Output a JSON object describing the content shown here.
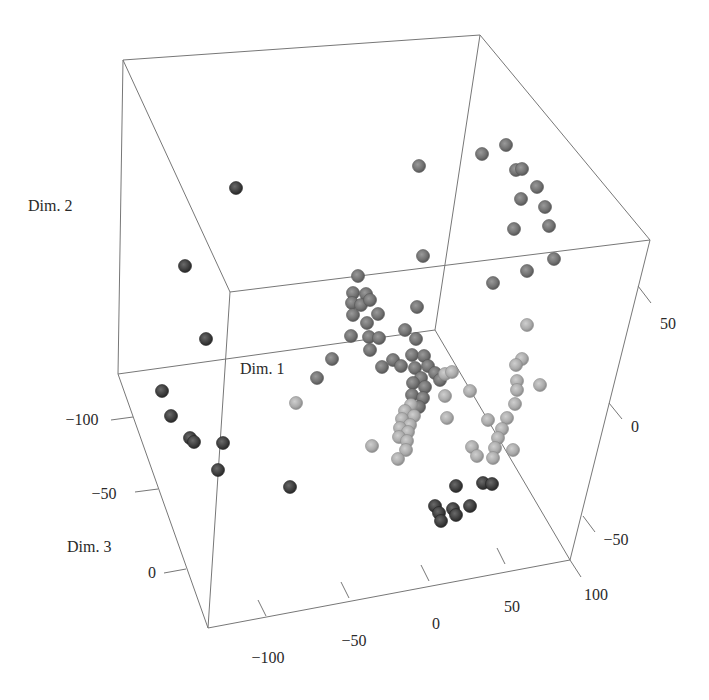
{
  "chart_data": {
    "type": "scatter",
    "subtype": "3d-scatter",
    "title": "",
    "axes": {
      "x": {
        "label": "Dim. 1",
        "ticks": [
          "-100",
          "-50",
          "0",
          "50",
          "100"
        ]
      },
      "y": {
        "label": "Dim. 2",
        "ticks": [
          "-50",
          "0",
          "50"
        ]
      },
      "z": {
        "label": "Dim. 3",
        "ticks": [
          "-100",
          "-50",
          "0"
        ]
      }
    },
    "grid": false,
    "legend": null,
    "colors": {
      "dark": "#3a3a3a",
      "mid": "#6e6e6e",
      "light": "#a9a9a9",
      "box": "#777777"
    },
    "box": {
      "vertices": {
        "A": [
          123,
          60
        ],
        "B": [
          480,
          35
        ],
        "C": [
          650,
          240
        ],
        "D": [
          230,
          292
        ],
        "E": [
          118,
          374
        ],
        "F": [
          208,
          628
        ],
        "G": [
          570,
          560
        ],
        "H": [
          435,
          330
        ]
      },
      "edges": [
        [
          "A",
          "B"
        ],
        [
          "A",
          "D"
        ],
        [
          "B",
          "C"
        ],
        [
          "D",
          "C"
        ],
        [
          "A",
          "E"
        ],
        [
          "E",
          "F"
        ],
        [
          "F",
          "G"
        ],
        [
          "G",
          "C"
        ],
        [
          "D",
          "F"
        ],
        [
          "B",
          "H"
        ],
        [
          "H",
          "G"
        ],
        [
          "E",
          "H"
        ]
      ]
    },
    "tick_marks": {
      "x": [
        {
          "label": "-100",
          "p": [
            258,
            600
          ],
          "t": [
            266,
            616
          ],
          "lx": 268,
          "ly": 663
        },
        {
          "label": "-50",
          "p": [
            341,
            582
          ],
          "t": [
            349,
            598
          ],
          "lx": 354,
          "ly": 646
        },
        {
          "label": "0",
          "p": [
            421,
            565
          ],
          "t": [
            429,
            581
          ],
          "lx": 436,
          "ly": 629
        },
        {
          "label": "50",
          "p": [
            497,
            548
          ],
          "t": [
            505,
            564
          ],
          "lx": 512,
          "ly": 612
        },
        {
          "label": "100",
          "p": [
            570,
            560
          ],
          "t": [
            581,
            577
          ],
          "lx": 596,
          "ly": 600
        }
      ],
      "y": [
        {
          "label": "50",
          "p": [
            638,
            286
          ],
          "t": [
            651,
            303
          ],
          "lx": 668,
          "ly": 329
        },
        {
          "label": "0",
          "p": [
            609,
            403
          ],
          "t": [
            622,
            419
          ],
          "lx": 635,
          "ly": 432
        },
        {
          "label": "-50",
          "p": [
            583,
            516
          ],
          "t": [
            595,
            532
          ],
          "lx": 616,
          "ly": 545
        }
      ],
      "z": [
        {
          "label": "-100",
          "p": [
            133,
            417
          ],
          "t": [
            111,
            420
          ],
          "lx": 82,
          "ly": 425
        },
        {
          "label": "-50",
          "p": [
            158,
            489
          ],
          "t": [
            135,
            492
          ],
          "lx": 104,
          "ly": 499
        },
        {
          "label": "0",
          "p": [
            186,
            569
          ],
          "t": [
            164,
            573
          ],
          "lx": 152,
          "ly": 578
        }
      ]
    },
    "label_positions": {
      "dim1": [
        240,
        374
      ],
      "dim2": [
        28,
        211
      ],
      "dim3": [
        67,
        552
      ]
    },
    "points": [
      {
        "x": 236,
        "y": 188,
        "c": "dark"
      },
      {
        "x": 185,
        "y": 266,
        "c": "dark"
      },
      {
        "x": 206,
        "y": 339,
        "c": "dark"
      },
      {
        "x": 162,
        "y": 391,
        "c": "dark"
      },
      {
        "x": 171,
        "y": 416,
        "c": "dark"
      },
      {
        "x": 190,
        "y": 438,
        "c": "dark"
      },
      {
        "x": 194,
        "y": 442,
        "c": "dark"
      },
      {
        "x": 223,
        "y": 443,
        "c": "dark"
      },
      {
        "x": 218,
        "y": 470,
        "c": "dark"
      },
      {
        "x": 290,
        "y": 487,
        "c": "dark"
      },
      {
        "x": 419,
        "y": 166,
        "c": "mid"
      },
      {
        "x": 482,
        "y": 154,
        "c": "mid"
      },
      {
        "x": 506,
        "y": 145,
        "c": "mid"
      },
      {
        "x": 516,
        "y": 170,
        "c": "mid"
      },
      {
        "x": 522,
        "y": 169,
        "c": "mid"
      },
      {
        "x": 537,
        "y": 187,
        "c": "mid"
      },
      {
        "x": 521,
        "y": 199,
        "c": "mid"
      },
      {
        "x": 545,
        "y": 207,
        "c": "mid"
      },
      {
        "x": 514,
        "y": 229,
        "c": "mid"
      },
      {
        "x": 549,
        "y": 226,
        "c": "mid"
      },
      {
        "x": 423,
        "y": 256,
        "c": "mid"
      },
      {
        "x": 554,
        "y": 259,
        "c": "mid"
      },
      {
        "x": 527,
        "y": 271,
        "c": "mid"
      },
      {
        "x": 493,
        "y": 283,
        "c": "mid"
      },
      {
        "x": 417,
        "y": 307,
        "c": "mid"
      },
      {
        "x": 358,
        "y": 276,
        "c": "mid"
      },
      {
        "x": 353,
        "y": 293,
        "c": "mid"
      },
      {
        "x": 366,
        "y": 294,
        "c": "mid"
      },
      {
        "x": 352,
        "y": 303,
        "c": "mid"
      },
      {
        "x": 361,
        "y": 305,
        "c": "mid"
      },
      {
        "x": 370,
        "y": 300,
        "c": "mid"
      },
      {
        "x": 353,
        "y": 315,
        "c": "mid"
      },
      {
        "x": 378,
        "y": 314,
        "c": "mid"
      },
      {
        "x": 367,
        "y": 323,
        "c": "mid"
      },
      {
        "x": 351,
        "y": 336,
        "c": "mid"
      },
      {
        "x": 369,
        "y": 337,
        "c": "mid"
      },
      {
        "x": 379,
        "y": 338,
        "c": "mid"
      },
      {
        "x": 370,
        "y": 350,
        "c": "mid"
      },
      {
        "x": 405,
        "y": 330,
        "c": "mid"
      },
      {
        "x": 416,
        "y": 339,
        "c": "mid"
      },
      {
        "x": 332,
        "y": 359,
        "c": "mid"
      },
      {
        "x": 317,
        "y": 378,
        "c": "mid"
      },
      {
        "x": 382,
        "y": 367,
        "c": "mid"
      },
      {
        "x": 393,
        "y": 360,
        "c": "mid"
      },
      {
        "x": 401,
        "y": 366,
        "c": "mid"
      },
      {
        "x": 412,
        "y": 355,
        "c": "mid"
      },
      {
        "x": 424,
        "y": 356,
        "c": "mid"
      },
      {
        "x": 415,
        "y": 368,
        "c": "mid"
      },
      {
        "x": 428,
        "y": 366,
        "c": "mid"
      },
      {
        "x": 435,
        "y": 373,
        "c": "mid"
      },
      {
        "x": 421,
        "y": 378,
        "c": "mid"
      },
      {
        "x": 440,
        "y": 380,
        "c": "mid"
      },
      {
        "x": 445,
        "y": 374,
        "c": "light"
      },
      {
        "x": 452,
        "y": 372,
        "c": "light"
      },
      {
        "x": 413,
        "y": 383,
        "c": "mid"
      },
      {
        "x": 425,
        "y": 387,
        "c": "mid"
      },
      {
        "x": 412,
        "y": 395,
        "c": "mid"
      },
      {
        "x": 423,
        "y": 398,
        "c": "mid"
      },
      {
        "x": 419,
        "y": 407,
        "c": "mid"
      },
      {
        "x": 411,
        "y": 405,
        "c": "light"
      },
      {
        "x": 405,
        "y": 411,
        "c": "light"
      },
      {
        "x": 414,
        "y": 416,
        "c": "light"
      },
      {
        "x": 402,
        "y": 419,
        "c": "light"
      },
      {
        "x": 410,
        "y": 425,
        "c": "light"
      },
      {
        "x": 400,
        "y": 428,
        "c": "light"
      },
      {
        "x": 408,
        "y": 432,
        "c": "light"
      },
      {
        "x": 399,
        "y": 437,
        "c": "light"
      },
      {
        "x": 407,
        "y": 441,
        "c": "light"
      },
      {
        "x": 406,
        "y": 450,
        "c": "light"
      },
      {
        "x": 398,
        "y": 459,
        "c": "light"
      },
      {
        "x": 372,
        "y": 446,
        "c": "light"
      },
      {
        "x": 296,
        "y": 403,
        "c": "light"
      },
      {
        "x": 445,
        "y": 396,
        "c": "light"
      },
      {
        "x": 447,
        "y": 418,
        "c": "light"
      },
      {
        "x": 470,
        "y": 391,
        "c": "light"
      },
      {
        "x": 488,
        "y": 420,
        "c": "light"
      },
      {
        "x": 472,
        "y": 447,
        "c": "light"
      },
      {
        "x": 477,
        "y": 456,
        "c": "light"
      },
      {
        "x": 527,
        "y": 325,
        "c": "light"
      },
      {
        "x": 522,
        "y": 359,
        "c": "light"
      },
      {
        "x": 516,
        "y": 365,
        "c": "light"
      },
      {
        "x": 517,
        "y": 381,
        "c": "light"
      },
      {
        "x": 517,
        "y": 390,
        "c": "light"
      },
      {
        "x": 515,
        "y": 404,
        "c": "light"
      },
      {
        "x": 540,
        "y": 385,
        "c": "light"
      },
      {
        "x": 507,
        "y": 418,
        "c": "light"
      },
      {
        "x": 502,
        "y": 429,
        "c": "light"
      },
      {
        "x": 498,
        "y": 438,
        "c": "light"
      },
      {
        "x": 495,
        "y": 448,
        "c": "light"
      },
      {
        "x": 493,
        "y": 458,
        "c": "light"
      },
      {
        "x": 513,
        "y": 450,
        "c": "light"
      },
      {
        "x": 456,
        "y": 486,
        "c": "dark"
      },
      {
        "x": 483,
        "y": 483,
        "c": "dark"
      },
      {
        "x": 492,
        "y": 484,
        "c": "dark"
      },
      {
        "x": 435,
        "y": 506,
        "c": "dark"
      },
      {
        "x": 439,
        "y": 513,
        "c": "dark"
      },
      {
        "x": 441,
        "y": 521,
        "c": "dark"
      },
      {
        "x": 453,
        "y": 509,
        "c": "dark"
      },
      {
        "x": 456,
        "y": 515,
        "c": "dark"
      },
      {
        "x": 470,
        "y": 506,
        "c": "dark"
      }
    ]
  }
}
